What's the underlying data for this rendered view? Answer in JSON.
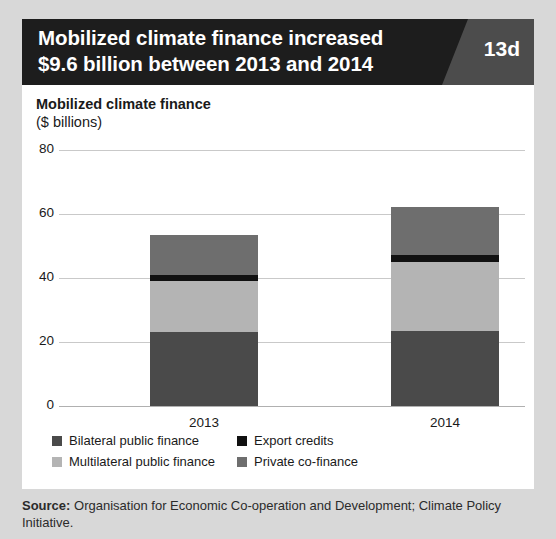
{
  "header": {
    "title_line1": "Mobilized climate finance increased",
    "title_line2": "$9.6 billion between 2013 and 2014",
    "figure_badge": "13d"
  },
  "chart_data": {
    "type": "bar",
    "title": "Mobilized climate finance",
    "subtitle": "($ billions)",
    "xlabel": "",
    "ylabel": "Mobilized climate finance ($ billions)",
    "stacked": true,
    "grid": true,
    "legend_position": "bottom",
    "categories": [
      "2013",
      "2014"
    ],
    "ylim": [
      0,
      80
    ],
    "yticks": [
      0,
      20,
      40,
      60,
      80
    ],
    "series": [
      {
        "name": "Bilateral public finance",
        "color": "#4a4a4a",
        "values": [
          23.1,
          23.4
        ]
      },
      {
        "name": "Multilateral public finance",
        "color": "#b4b4b4",
        "values": [
          15.9,
          21.6
        ]
      },
      {
        "name": "Export credits",
        "color": "#111111",
        "values": [
          1.9,
          2.2
        ]
      },
      {
        "name": "Private co-finance",
        "color": "#6e6e6e",
        "values": [
          12.5,
          15.0
        ]
      }
    ],
    "totals": [
      53.4,
      62.2
    ]
  },
  "legend": {
    "items": [
      {
        "label": "Bilateral public finance",
        "color": "#4a4a4a"
      },
      {
        "label": "Export credits",
        "color": "#111111"
      },
      {
        "label": "Multilateral public finance",
        "color": "#b4b4b4"
      },
      {
        "label": "Private co-finance",
        "color": "#6e6e6e"
      }
    ]
  },
  "source": {
    "label": "Source:",
    "text": " Organisation for Economic Co-operation and Development; Climate Policy Initiative."
  }
}
